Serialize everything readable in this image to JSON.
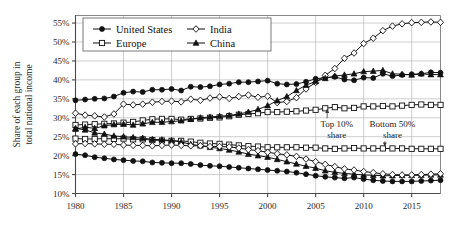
{
  "chart_data": {
    "type": "line",
    "title": "",
    "subtitle": "",
    "xlabel": "",
    "ylabel": "Share of each group in total national income",
    "xlim": [
      1980,
      2018
    ],
    "ylim": [
      10,
      57
    ],
    "ytick_values": [
      10,
      15,
      20,
      25,
      30,
      35,
      40,
      45,
      50,
      55
    ],
    "ytick_labels": [
      "10%",
      "15%",
      "20%",
      "25%",
      "30%",
      "35%",
      "40%",
      "45%",
      "50%",
      "55%"
    ],
    "xtick_values": [
      1980,
      1985,
      1990,
      1995,
      2000,
      2005,
      2010,
      2015
    ],
    "xtick_labels": [
      "1980",
      "1985",
      "1990",
      "1995",
      "2000",
      "2005",
      "2010",
      "2015"
    ],
    "grid": true,
    "legend_position": "top-left-inside",
    "annotations": [
      {
        "id": "top10",
        "label_line1": "Top 10%",
        "label_line2": "share",
        "x": 2007.2,
        "y_text": 27.5,
        "arrow_to_x": 2006.2,
        "arrow_to_y": 32.3
      },
      {
        "id": "bottom50",
        "label_line1": "Bottom 50%",
        "label_line2": "share",
        "x": 2013.0,
        "y_text": 27.5,
        "arrow_to_x": 2012.2,
        "arrow_to_y": 22.4
      }
    ],
    "x": [
      1980,
      1981,
      1982,
      1983,
      1984,
      1985,
      1986,
      1987,
      1988,
      1989,
      1990,
      1991,
      1992,
      1993,
      1994,
      1995,
      1996,
      1997,
      1998,
      1999,
      2000,
      2001,
      2002,
      2003,
      2004,
      2005,
      2006,
      2007,
      2008,
      2009,
      2010,
      2011,
      2012,
      2013,
      2014,
      2015,
      2016,
      2017,
      2018
    ],
    "series": [
      {
        "name": "United States",
        "group": "Top 10% share",
        "marker": "filled-circle",
        "values": [
          34.6,
          34.8,
          35.0,
          35.1,
          35.6,
          36.6,
          36.9,
          36.8,
          37.4,
          37.4,
          37.6,
          37.2,
          38.2,
          38.1,
          38.3,
          38.8,
          39.0,
          39.4,
          39.4,
          39.6,
          39.8,
          39.0,
          38.8,
          38.9,
          39.5,
          40.3,
          40.6,
          40.8,
          40.1,
          39.9,
          40.6,
          40.5,
          41.6,
          41.0,
          41.3,
          41.5,
          41.6,
          42.0,
          41.9
        ]
      },
      {
        "name": "India",
        "group": "Top 10% share",
        "marker": "open-diamond",
        "values": [
          31.2,
          30.7,
          30.5,
          30.2,
          31.0,
          33.6,
          33.4,
          33.6,
          34.1,
          34.3,
          34.4,
          34.2,
          34.9,
          34.6,
          35.2,
          35.5,
          35.1,
          35.6,
          36.0,
          35.4,
          35.7,
          34.0,
          34.3,
          35.3,
          37.6,
          39.3,
          41.2,
          43.0,
          45.7,
          47.1,
          49.6,
          51.0,
          53.0,
          54.2,
          54.8,
          55.1,
          55.2,
          55.3,
          55.2
        ]
      },
      {
        "name": "Europe",
        "group": "Top 10% share",
        "marker": "open-square",
        "values": [
          28.1,
          28.2,
          28.3,
          28.4,
          28.5,
          28.7,
          28.9,
          29.3,
          29.6,
          29.7,
          29.7,
          29.5,
          29.7,
          29.8,
          30.0,
          30.1,
          30.4,
          30.8,
          31.0,
          31.2,
          31.5,
          31.5,
          31.6,
          31.7,
          31.9,
          32.1,
          32.5,
          32.8,
          32.5,
          32.6,
          33.0,
          33.0,
          33.1,
          33.0,
          33.2,
          33.4,
          33.5,
          33.4,
          33.4
        ]
      },
      {
        "name": "China",
        "group": "Top 10% share",
        "marker": "filled-triangle",
        "values": [
          27.0,
          27.5,
          27.2,
          27.9,
          28.2,
          28.3,
          28.1,
          28.4,
          28.8,
          28.8,
          29.0,
          29.2,
          29.6,
          30.0,
          30.2,
          30.4,
          30.6,
          31.0,
          31.5,
          32.2,
          33.2,
          34.5,
          35.6,
          37.2,
          38.6,
          39.6,
          40.4,
          41.0,
          41.3,
          41.6,
          42.2,
          42.3,
          42.5,
          41.6,
          41.5,
          41.3,
          41.6,
          41.4,
          41.4
        ]
      },
      {
        "name": "Europe",
        "group": "Bottom 50% share",
        "marker": "open-square",
        "values": [
          24.5,
          24.4,
          24.4,
          24.5,
          24.4,
          24.5,
          24.3,
          24.3,
          24.1,
          24.0,
          23.9,
          23.9,
          23.7,
          23.4,
          23.2,
          23.1,
          22.9,
          22.7,
          22.5,
          22.4,
          22.2,
          22.2,
          22.2,
          22.2,
          22.1,
          22.1,
          21.9,
          21.8,
          21.9,
          22.0,
          21.9,
          21.9,
          21.9,
          21.9,
          21.9,
          21.8,
          21.8,
          21.8,
          21.8
        ]
      },
      {
        "name": "China",
        "group": "Bottom 50% share",
        "marker": "filled-triangle",
        "values": [
          27.2,
          26.8,
          26.0,
          25.7,
          25.2,
          25.0,
          24.8,
          24.6,
          24.3,
          24.2,
          24.0,
          23.6,
          23.0,
          22.6,
          22.2,
          21.9,
          21.5,
          21.0,
          20.4,
          20.0,
          19.6,
          19.0,
          18.4,
          17.8,
          17.2,
          16.7,
          16.0,
          15.6,
          15.3,
          15.1,
          14.9,
          14.8,
          14.7,
          14.7,
          14.8,
          14.8,
          14.8,
          14.9,
          14.9
        ]
      },
      {
        "name": "India",
        "group": "Bottom 50% share",
        "marker": "open-diamond",
        "values": [
          23.1,
          23.2,
          23.1,
          23.0,
          23.0,
          22.8,
          22.7,
          22.7,
          22.6,
          22.7,
          22.8,
          22.7,
          22.6,
          22.6,
          22.4,
          22.4,
          22.3,
          22.0,
          21.6,
          21.3,
          20.9,
          20.5,
          20.2,
          19.8,
          19.1,
          18.4,
          17.7,
          17.1,
          16.5,
          16.2,
          15.8,
          15.5,
          15.2,
          15.0,
          14.9,
          14.9,
          15.0,
          15.1,
          15.2
        ]
      },
      {
        "name": "United States",
        "group": "Bottom 50% share",
        "marker": "filled-circle",
        "values": [
          20.4,
          20.1,
          19.6,
          19.3,
          19.0,
          18.8,
          18.6,
          18.5,
          18.2,
          18.1,
          18.0,
          18.0,
          17.8,
          17.5,
          17.3,
          17.2,
          17.0,
          16.8,
          16.6,
          16.4,
          16.2,
          16.0,
          15.8,
          15.5,
          15.1,
          14.7,
          14.4,
          14.2,
          14.0,
          14.2,
          13.8,
          13.5,
          13.3,
          13.2,
          13.2,
          13.2,
          13.3,
          13.4,
          13.5
        ]
      }
    ],
    "legend": [
      {
        "label": "United States",
        "marker": "filled-circle"
      },
      {
        "label": "India",
        "marker": "open-diamond"
      },
      {
        "label": "Europe",
        "marker": "open-square"
      },
      {
        "label": "China",
        "marker": "filled-triangle"
      }
    ]
  }
}
